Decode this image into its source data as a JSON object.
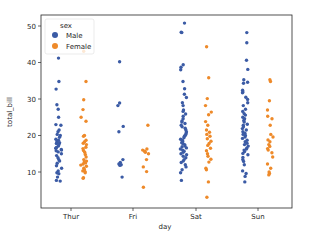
{
  "chart_data": {
    "type": "scatter",
    "subtype": "stripplot",
    "title": "",
    "xlabel": "day",
    "ylabel": "total_bill",
    "categories": [
      "Thur",
      "Fri",
      "Sat",
      "Sun"
    ],
    "yticks": [
      10,
      20,
      30,
      40,
      50
    ],
    "ylim": [
      1,
      53
    ],
    "grid": false,
    "legend": {
      "title": "sex",
      "position": "upper left",
      "entries": [
        "Male",
        "Female"
      ]
    },
    "series": [
      {
        "name": "Male",
        "color": "#3b5ba5",
        "offset": -0.2,
        "values": {
          "Thur": [
            41.2,
            34.8,
            32.7,
            28.4,
            27.2,
            25.0,
            23.0,
            22.8,
            21.5,
            21.0,
            20.3,
            20.0,
            19.5,
            19.0,
            18.7,
            18.3,
            18.0,
            17.8,
            17.5,
            17.1,
            16.7,
            16.5,
            16.2,
            16.0,
            15.8,
            15.5,
            15.0,
            14.5,
            13.9,
            13.4,
            13.0,
            12.4,
            11.7,
            11.0,
            10.3,
            9.8,
            9.5,
            8.6,
            7.7,
            7.5
          ],
          "Fri": [
            40.2,
            28.9,
            28.2,
            22.5,
            21.0,
            13.4,
            12.6,
            12.2,
            12.0,
            11.8,
            8.6
          ],
          "Sat": [
            50.8,
            48.3,
            48.2,
            39.4,
            38.7,
            38.0,
            34.8,
            32.8,
            31.3,
            30.4,
            29.0,
            28.2,
            27.0,
            26.6,
            25.9,
            25.3,
            24.6,
            24.0,
            23.7,
            23.3,
            22.8,
            22.4,
            22.0,
            21.6,
            21.0,
            20.7,
            20.3,
            20.0,
            19.8,
            19.4,
            19.0,
            18.7,
            18.4,
            18.0,
            17.8,
            17.5,
            17.1,
            16.9,
            16.6,
            16.3,
            16.0,
            15.7,
            15.4,
            15.0,
            14.7,
            14.3,
            13.9,
            13.4,
            13.0,
            12.6,
            12.0,
            11.4,
            10.6,
            9.8,
            7.7
          ],
          "Sun": [
            48.2,
            45.4,
            40.6,
            38.1,
            35.3,
            34.6,
            34.3,
            32.4,
            31.9,
            31.7,
            30.5,
            29.9,
            29.0,
            28.2,
            27.2,
            26.6,
            26.0,
            25.6,
            25.0,
            24.6,
            24.1,
            23.7,
            23.1,
            22.8,
            22.4,
            21.9,
            21.5,
            21.0,
            20.6,
            20.3,
            20.0,
            19.6,
            19.2,
            18.7,
            18.3,
            17.9,
            17.5,
            17.1,
            16.6,
            16.3,
            16.0,
            15.6,
            15.1,
            14.7,
            14.0,
            13.4,
            12.9,
            12.0,
            10.3,
            9.6,
            8.8,
            7.3
          ]
        }
      },
      {
        "name": "Female",
        "color": "#ee8a2a",
        "offset": 0.2,
        "values": {
          "Thur": [
            43.1,
            34.8,
            29.8,
            27.1,
            25.0,
            23.9,
            20.0,
            19.8,
            18.7,
            18.3,
            17.9,
            17.5,
            16.8,
            16.4,
            15.9,
            15.4,
            14.8,
            14.1,
            13.4,
            13.0,
            12.7,
            12.5,
            12.2,
            11.9,
            11.6,
            11.0,
            10.6,
            10.3,
            10.1,
            9.8,
            8.4,
            8.3
          ],
          "Fri": [
            22.8,
            16.3,
            16.0,
            15.7,
            15.4,
            15.0,
            13.4,
            11.4,
            10.1,
            5.8
          ],
          "Sat": [
            44.3,
            35.8,
            30.1,
            28.2,
            26.4,
            25.7,
            23.8,
            22.8,
            21.5,
            20.9,
            20.3,
            19.8,
            19.1,
            18.4,
            17.8,
            17.3,
            16.5,
            15.8,
            15.0,
            14.3,
            13.5,
            12.7,
            11.0,
            10.6,
            7.3,
            3.1
          ],
          "Sun": [
            35.3,
            34.8,
            29.5,
            27.0,
            25.3,
            24.6,
            22.8,
            20.3,
            19.6,
            18.8,
            18.3,
            17.5,
            17.0,
            16.4,
            16.0,
            15.3,
            14.1,
            12.2,
            11.0,
            10.0,
            9.6,
            9.2
          ]
        }
      }
    ]
  }
}
